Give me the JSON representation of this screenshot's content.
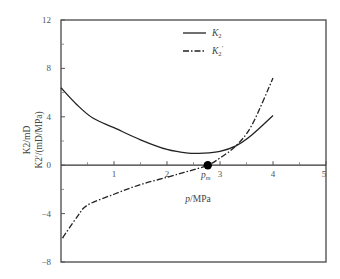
{
  "chart_data": {
    "type": "line",
    "title": "",
    "xlabel": "p/MPa",
    "ylabel_line1": "K2/mD",
    "ylabel_line2": "K2'/(mD/MPa)",
    "xlim": [
      0,
      5
    ],
    "ylim": [
      -8,
      12
    ],
    "xticks": [
      1,
      2,
      3,
      4,
      5
    ],
    "yticks": [
      12,
      8,
      4,
      0,
      -4,
      -8
    ],
    "ytick_labels": [
      "12",
      "8",
      "4",
      "0",
      "−4",
      "−8"
    ],
    "xtick_labels": [
      "1",
      "2",
      "3",
      "4",
      "5"
    ],
    "grid": false,
    "legend_position": "top-center",
    "legend": [
      {
        "label": "K2",
        "sub": "2",
        "prime": "",
        "style": "solid"
      },
      {
        "label": "K2'",
        "sub": "2",
        "prime": "′",
        "style": "dash-dot"
      }
    ],
    "series": [
      {
        "name": "K2",
        "style": "solid",
        "x": [
          0,
          0.3,
          0.6,
          1.0,
          1.5,
          2.0,
          2.4,
          2.7,
          3.0,
          3.3,
          3.6,
          4.0
        ],
        "y": [
          6.4,
          5.0,
          3.9,
          3.1,
          2.1,
          1.3,
          1.0,
          1.0,
          1.15,
          1.6,
          2.5,
          4.1
        ]
      },
      {
        "name": "K2'",
        "style": "dash-dot",
        "x": [
          0.03,
          0.3,
          0.5,
          1.0,
          1.5,
          2.0,
          2.4,
          2.77,
          3.0,
          3.3,
          3.6,
          4.0
        ],
        "y": [
          -6.0,
          -4.3,
          -3.3,
          -2.4,
          -1.6,
          -1.0,
          -0.5,
          0.0,
          0.6,
          1.6,
          3.3,
          7.2
        ]
      }
    ],
    "annotations": [
      {
        "text": "p",
        "sub": "m",
        "x": 2.77,
        "y": 0,
        "marker": "filled-circle"
      }
    ]
  }
}
